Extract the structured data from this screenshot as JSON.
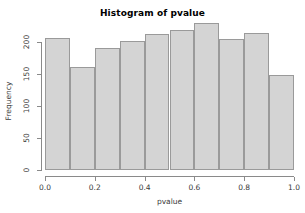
{
  "chart_data": {
    "type": "bar",
    "title": "Histogram of pvalue",
    "xlabel": "pvalue",
    "ylabel": "Frequency",
    "categories": [
      "0.0-0.1",
      "0.1-0.2",
      "0.2-0.3",
      "0.3-0.4",
      "0.4-0.5",
      "0.5-0.6",
      "0.6-0.7",
      "0.7-0.8",
      "0.8-0.9",
      "0.9-1.0"
    ],
    "bin_edges": [
      0.0,
      0.1,
      0.2,
      0.3,
      0.4,
      0.5,
      0.6,
      0.7,
      0.8,
      0.9,
      1.0
    ],
    "values": [
      206,
      161,
      190,
      202,
      212,
      219,
      229,
      205,
      214,
      148
    ],
    "xlim": [
      0.0,
      1.0
    ],
    "ylim": [
      0,
      229
    ],
    "y_axis_max_tick": 200,
    "xticks": [
      "0.0",
      "0.2",
      "0.4",
      "0.6",
      "0.8",
      "1.0"
    ],
    "xtick_values": [
      0.0,
      0.2,
      0.4,
      0.6,
      0.8,
      1.0
    ],
    "yticks": [
      "0",
      "50",
      "100",
      "150",
      "200"
    ],
    "ytick_values": [
      0,
      50,
      100,
      150,
      200
    ],
    "grid": false,
    "legend": null,
    "bar_fill_color": "#d4d4d4",
    "bar_border_color": "#9a9a9a",
    "axis_color": "#8a8a8a",
    "background_color": "#ffffff"
  }
}
